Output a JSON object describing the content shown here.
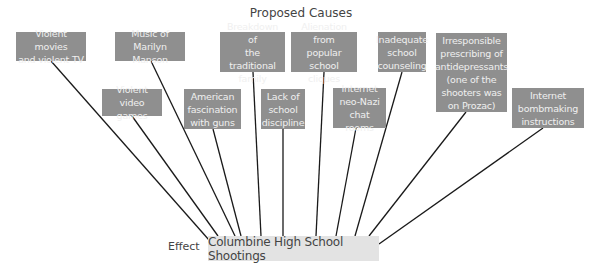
{
  "diagram": {
    "title": "Proposed Causes",
    "effect_label": "Effect",
    "effect": "Columbine High School Shootings",
    "causes": [
      {
        "id": "violent-movies",
        "lines": [
          "Violent movies",
          "and violent TV"
        ]
      },
      {
        "id": "marilyn-manson",
        "lines": [
          "Music of",
          "Marilyn Manson"
        ]
      },
      {
        "id": "family-breakdown",
        "lines": [
          "Breakdown of",
          "the traditional",
          "family"
        ]
      },
      {
        "id": "alienation",
        "lines": [
          "Alienation from",
          "popular school",
          "cliques"
        ]
      },
      {
        "id": "counseling",
        "lines": [
          "Inadequate",
          "school",
          "counseling"
        ]
      },
      {
        "id": "antidepressants",
        "lines": [
          "Irresponsible",
          "prescribing of",
          "antidepressants",
          "(one of the",
          "shooters was",
          "on Prozac)"
        ]
      },
      {
        "id": "video-games",
        "lines": [
          "Violent video",
          "games"
        ]
      },
      {
        "id": "guns",
        "lines": [
          "American",
          "fascination",
          "with guns"
        ]
      },
      {
        "id": "discipline",
        "lines": [
          "Lack of",
          "school",
          "discipline"
        ]
      },
      {
        "id": "neo-nazi",
        "lines": [
          "Internet",
          "neo-Nazi",
          "chat rooms"
        ]
      },
      {
        "id": "bombmaking",
        "lines": [
          "Internet",
          "bombmaking",
          "instructions"
        ]
      }
    ],
    "colors": {
      "cause_box": "#8f8f8f",
      "cause_text": "#f0f0f0",
      "effect_box": "#e3e3e3",
      "line": "#1a1a1a"
    }
  }
}
